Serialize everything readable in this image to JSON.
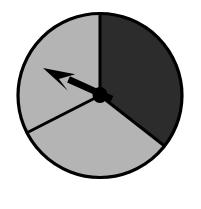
{
  "figure": {
    "width": 201,
    "height": 209,
    "background_color": "#ffffff"
  },
  "colors": {
    "outline": "#000000",
    "dark_sector": "#2c2c2c",
    "light_sector": "#b4b4b4",
    "pointer": "#000000",
    "hub": "#000000",
    "background": "#ffffff"
  },
  "circle": {
    "center_x": 100,
    "center_y": 95.5,
    "radius": 82,
    "outline_width": 3.2
  },
  "chart_data": {
    "type": "pie",
    "categories": [
      "dark-sector",
      "light-sector-left",
      "light-sector-bottom"
    ],
    "values": [
      128,
      115,
      117
    ],
    "unit": "degrees",
    "labels": [
      "",
      "",
      ""
    ],
    "colors": [
      "#2c2c2c",
      "#b4b4b4",
      "#b4b4b4"
    ],
    "start_angle_deg": 90,
    "direction": "clockwise",
    "legend": "none",
    "grid": false,
    "sectors": [
      {
        "name": "dark-sector",
        "fill": "#2c2c2c",
        "start_deg": 90,
        "end_deg": -38,
        "sweep_deg": 128
      },
      {
        "name": "light-sector-bottom",
        "fill": "#b4b4b4",
        "start_deg": -38,
        "end_deg": -153,
        "sweep_deg": 115
      },
      {
        "name": "light-sector-left",
        "fill": "#b4b4b4",
        "start_deg": -153,
        "end_deg": 90,
        "sweep_deg": 117
      }
    ],
    "boundaries": [
      {
        "name": "boundary-top",
        "angle_deg": 90,
        "end_x": 100,
        "end_y": 13
      },
      {
        "name": "boundary-lower-right",
        "angle_deg": -38,
        "end_x": 168,
        "end_y": 140
      },
      {
        "name": "boundary-lower-left",
        "angle_deg": -153,
        "end_x": 31,
        "end_y": 136
      }
    ]
  },
  "pointer": {
    "name": "spinner-arrow",
    "angle_deg": 155,
    "tip_x": 43,
    "tip_y": 68,
    "tail_x": 112,
    "tail_y": 99,
    "color": "#000000"
  },
  "hub": {
    "name": "spinner-hub",
    "center_x": 100,
    "center_y": 95,
    "radius_x": 7.5,
    "radius_y": 8,
    "color": "#000000"
  }
}
